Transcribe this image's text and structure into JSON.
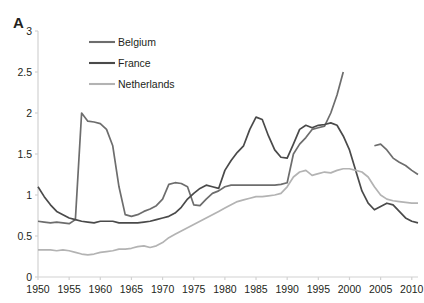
{
  "panel": {
    "label": "A"
  },
  "legend": {
    "position": "top-left-inside",
    "entries": [
      {
        "label": "Belgium",
        "color": "#6d6d6d"
      },
      {
        "label": "France",
        "color": "#4a4a4a"
      },
      {
        "label": "Netherlands",
        "color": "#b3b3b3"
      }
    ]
  },
  "axes": {
    "y_ticks": [
      "0",
      "0.5",
      "1",
      "1.5",
      "2",
      "2.5",
      "3"
    ],
    "x_ticks": [
      "1950",
      "1955",
      "1960",
      "1965",
      "1970",
      "1975",
      "1980",
      "1985",
      "1990",
      "1995",
      "2000",
      "2005",
      "2010"
    ]
  },
  "chart_data": {
    "type": "line",
    "title": "",
    "xlabel": "",
    "ylabel": "",
    "xlim": [
      1950,
      2011
    ],
    "ylim": [
      0,
      3
    ],
    "grid": false,
    "legend_position": "top-left-inside",
    "series": [
      {
        "name": "Belgium",
        "color": "#6d6d6d",
        "x": [
          1950,
          1951,
          1952,
          1953,
          1954,
          1955,
          1956,
          1957,
          1958,
          1959,
          1960,
          1961,
          1962,
          1963,
          1964,
          1965,
          1966,
          1967,
          1968,
          1969,
          1970,
          1971,
          1972,
          1973,
          1974,
          1975,
          1976,
          1977,
          1978,
          1979,
          1980,
          1981,
          1982,
          1983,
          1984,
          1985,
          1986,
          1987,
          1988,
          1989,
          1990,
          1991,
          1992,
          1993,
          1994,
          1995,
          1996,
          1997,
          1998,
          1999,
          2004,
          2005,
          2006,
          2007,
          2008,
          2009,
          2010,
          2011
        ],
        "y": [
          0.68,
          0.67,
          0.66,
          0.67,
          0.66,
          0.65,
          0.7,
          2.0,
          1.9,
          1.89,
          1.87,
          1.8,
          1.6,
          1.1,
          0.76,
          0.74,
          0.76,
          0.8,
          0.83,
          0.87,
          0.95,
          1.13,
          1.15,
          1.14,
          1.1,
          0.88,
          0.87,
          0.95,
          1.02,
          1.05,
          1.1,
          1.12,
          1.12,
          1.12,
          1.12,
          1.12,
          1.12,
          1.12,
          1.12,
          1.13,
          1.15,
          1.5,
          1.62,
          1.7,
          1.8,
          1.82,
          1.84,
          2.0,
          2.22,
          2.5,
          1.6,
          1.62,
          1.55,
          1.45,
          1.4,
          1.36,
          1.3,
          1.25
        ]
      },
      {
        "name": "France",
        "color": "#4a4a4a",
        "x": [
          1950,
          1951,
          1952,
          1953,
          1954,
          1955,
          1956,
          1957,
          1958,
          1959,
          1960,
          1961,
          1962,
          1963,
          1964,
          1965,
          1966,
          1967,
          1968,
          1969,
          1970,
          1971,
          1972,
          1973,
          1974,
          1975,
          1976,
          1977,
          1978,
          1979,
          1980,
          1981,
          1982,
          1983,
          1984,
          1985,
          1986,
          1987,
          1988,
          1989,
          1990,
          1991,
          1992,
          1993,
          1994,
          1995,
          1996,
          1997,
          1998,
          1999,
          2000,
          2001,
          2002,
          2003,
          2004,
          2005,
          2006,
          2007,
          2008,
          2009,
          2010,
          2011
        ],
        "y": [
          1.1,
          0.98,
          0.88,
          0.8,
          0.76,
          0.72,
          0.7,
          0.68,
          0.67,
          0.66,
          0.68,
          0.68,
          0.68,
          0.66,
          0.66,
          0.66,
          0.66,
          0.67,
          0.68,
          0.7,
          0.72,
          0.74,
          0.78,
          0.85,
          0.95,
          1.02,
          1.08,
          1.12,
          1.1,
          1.08,
          1.3,
          1.42,
          1.52,
          1.6,
          1.8,
          1.95,
          1.92,
          1.72,
          1.55,
          1.46,
          1.45,
          1.62,
          1.8,
          1.85,
          1.82,
          1.85,
          1.86,
          1.88,
          1.85,
          1.72,
          1.55,
          1.3,
          1.05,
          0.9,
          0.82,
          0.86,
          0.9,
          0.88,
          0.8,
          0.72,
          0.68,
          0.66
        ]
      },
      {
        "name": "Netherlands",
        "color": "#b3b3b3",
        "x": [
          1950,
          1951,
          1952,
          1953,
          1954,
          1955,
          1956,
          1957,
          1958,
          1959,
          1960,
          1961,
          1962,
          1963,
          1964,
          1965,
          1966,
          1967,
          1968,
          1969,
          1970,
          1971,
          1972,
          1973,
          1974,
          1975,
          1976,
          1977,
          1978,
          1979,
          1980,
          1981,
          1982,
          1983,
          1984,
          1985,
          1986,
          1987,
          1988,
          1989,
          1990,
          1991,
          1992,
          1993,
          1994,
          1995,
          1996,
          1997,
          1998,
          1999,
          2000,
          2001,
          2002,
          2003,
          2004,
          2005,
          2006,
          2007,
          2008,
          2009,
          2010,
          2011
        ],
        "y": [
          0.33,
          0.33,
          0.33,
          0.32,
          0.33,
          0.32,
          0.3,
          0.28,
          0.27,
          0.28,
          0.3,
          0.31,
          0.32,
          0.34,
          0.34,
          0.35,
          0.37,
          0.38,
          0.36,
          0.38,
          0.42,
          0.48,
          0.52,
          0.56,
          0.6,
          0.64,
          0.68,
          0.72,
          0.76,
          0.8,
          0.84,
          0.88,
          0.92,
          0.94,
          0.96,
          0.98,
          0.98,
          0.99,
          1.0,
          1.02,
          1.1,
          1.22,
          1.28,
          1.3,
          1.24,
          1.26,
          1.28,
          1.27,
          1.3,
          1.32,
          1.32,
          1.3,
          1.28,
          1.22,
          1.1,
          1.0,
          0.95,
          0.93,
          0.92,
          0.91,
          0.9,
          0.9
        ]
      }
    ]
  }
}
